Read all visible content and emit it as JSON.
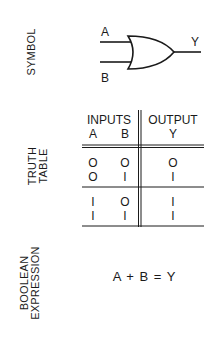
{
  "sections": {
    "symbol": {
      "label": "SYMBOL"
    },
    "truth_table": {
      "label_line1": "TRUTH",
      "label_line2": "TABLE"
    },
    "boolean": {
      "label_line1": "BOOLEAN",
      "label_line2": "EXPRESSION"
    }
  },
  "gate": {
    "type": "OR",
    "input_a": "A",
    "input_b": "B",
    "output": "Y"
  },
  "table": {
    "group_inputs": "INPUTS",
    "group_output": "OUTPUT",
    "columns": [
      "A",
      "B",
      "Y"
    ],
    "rows": [
      [
        "O",
        "O",
        "O"
      ],
      [
        "O",
        "I",
        "I"
      ],
      [
        "I",
        "O",
        "I"
      ],
      [
        "I",
        "I",
        "I"
      ]
    ]
  },
  "expression": "A + B = Y"
}
